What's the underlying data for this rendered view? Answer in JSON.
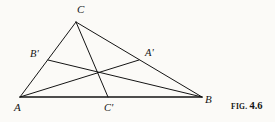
{
  "figure": {
    "caption_prefix": "FIG.",
    "caption_number": "4.6",
    "background_color": "#fbfaf7",
    "ink_color": "#141414"
  },
  "labels": {
    "vertex_a": "A",
    "vertex_b": "B",
    "vertex_c": "C",
    "midpoint_a_prime": "A'",
    "midpoint_b_prime": "B'",
    "midpoint_c_prime": "C'"
  },
  "chart_data": {
    "type": "diagram",
    "points": [
      {
        "name": "A",
        "x": 20,
        "y": 97,
        "role": "vertex",
        "label": "A",
        "label_x": 14,
        "label_y": 102
      },
      {
        "name": "B",
        "x": 202,
        "y": 97,
        "role": "vertex",
        "label": "B",
        "label_x": 205,
        "label_y": 94
      },
      {
        "name": "C",
        "x": 76,
        "y": 22,
        "role": "vertex",
        "label": "C",
        "label_x": 77,
        "label_y": 4
      },
      {
        "name": "A'",
        "x": 139,
        "y": 60,
        "role": "midpoint",
        "label": "A'",
        "label_x": 145,
        "label_y": 48
      },
      {
        "name": "B'",
        "x": 48,
        "y": 60,
        "role": "midpoint",
        "label": "B'",
        "label_x": 30,
        "label_y": 49
      },
      {
        "name": "C'",
        "x": 108,
        "y": 97,
        "role": "midpoint",
        "label": "C'",
        "label_x": 104,
        "label_y": 103
      },
      {
        "name": "G",
        "x": 99,
        "y": 73,
        "role": "centroid",
        "label": "",
        "label_x": 0,
        "label_y": 0
      }
    ],
    "segments": [
      {
        "name": "side-AB",
        "from": "A",
        "to": "B",
        "x1": 20,
        "y1": 97,
        "x2": 202,
        "y2": 97,
        "width": 1.5
      },
      {
        "name": "side-AC",
        "from": "A",
        "to": "C",
        "x1": 20,
        "y1": 97,
        "x2": 76,
        "y2": 22,
        "width": 1.0
      },
      {
        "name": "side-CB",
        "from": "C",
        "to": "B",
        "x1": 76,
        "y1": 22,
        "x2": 202,
        "y2": 97,
        "width": 1.0
      },
      {
        "name": "median-CC",
        "from": "C",
        "to": "C'",
        "x1": 76,
        "y1": 22,
        "x2": 108,
        "y2": 97,
        "width": 1.0
      },
      {
        "name": "median-AA",
        "from": "A",
        "to": "A'",
        "x1": 20,
        "y1": 97,
        "x2": 139,
        "y2": 60,
        "width": 1.0
      },
      {
        "name": "median-BB",
        "from": "B",
        "to": "B'",
        "x1": 202,
        "y1": 97,
        "x2": 48,
        "y2": 60,
        "width": 1.0
      }
    ],
    "xlim": [
      0,
      275
    ],
    "ylim": [
      0,
      122
    ],
    "grid": false,
    "legend": "none"
  }
}
